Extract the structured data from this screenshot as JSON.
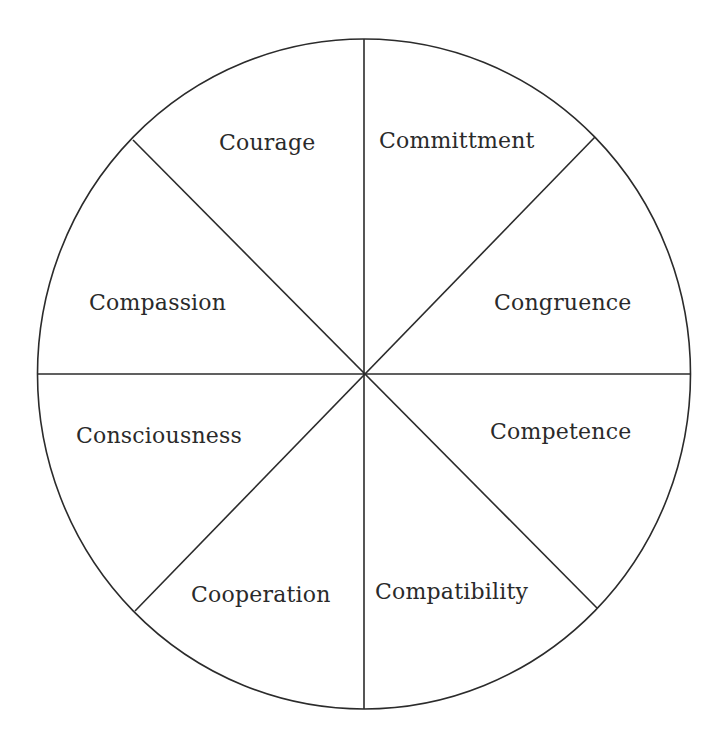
{
  "diagram": {
    "type": "segmented-wheel",
    "center": [
      364,
      374
    ],
    "radius": 334,
    "stroke_color": "#2b2b2b",
    "text_color": "#2a2a2a",
    "background": "#ffffff",
    "segments": [
      {
        "label": "Commitment_placeholder_fix",
        "id": "committment"
      }
    ],
    "labels": {
      "courage": "Courage",
      "committment": "Committment",
      "compassion": "Compassion",
      "congruence": "Congruence",
      "consciousness": "Consciousness",
      "competence": "Competence",
      "cooperation": "Cooperation",
      "compatibility": "Compatibility"
    },
    "segment_order_clockwise_from_top": [
      "Committment",
      "Congruence",
      "Competence",
      "Compatibility",
      "Cooperation",
      "Consciousness",
      "Compassion",
      "Courage"
    ]
  }
}
